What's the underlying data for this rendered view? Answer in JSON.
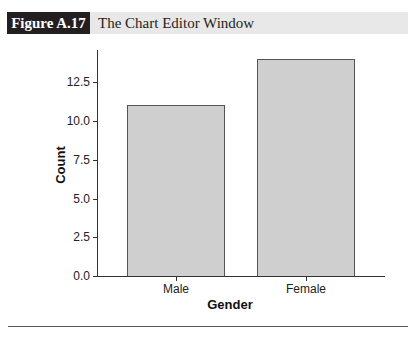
{
  "figure": {
    "label": "Figure A.17",
    "title": "The Chart Editor Window"
  },
  "chart_data": {
    "type": "bar",
    "title": "",
    "categories": [
      "Male",
      "Female"
    ],
    "values": [
      11,
      14
    ],
    "xlabel": "Gender",
    "ylabel": "Count",
    "ylim": [
      0,
      14
    ],
    "yticks": [
      "0.0",
      "2.5",
      "5.0",
      "7.5",
      "10.0",
      "12.5"
    ],
    "grid": false,
    "legend": null,
    "bar_color": "#cfcfcf"
  }
}
